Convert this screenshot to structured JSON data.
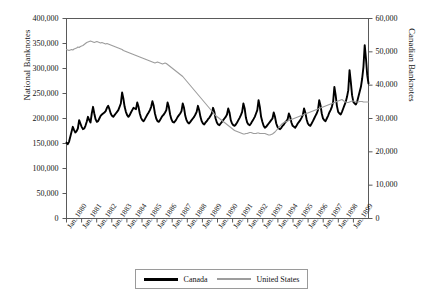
{
  "chart_data": {
    "type": "line",
    "title": "",
    "subtitle": "",
    "xlabel": "",
    "ylabel": "National Banknotes",
    "ylabel_right": "Canadian Banknotes",
    "grid": false,
    "legend_position": "bottom",
    "xlim": [
      "Jan. 1880",
      "Jan. 1899"
    ],
    "ylim": [
      0,
      400000
    ],
    "ylim_right": [
      0,
      60000
    ],
    "yticks": [
      0,
      50000,
      100000,
      150000,
      200000,
      250000,
      300000,
      350000,
      400000
    ],
    "ytick_labels": [
      "0",
      "50,000",
      "100,000",
      "150,000",
      "200,000",
      "250,000",
      "300,000",
      "350,000",
      "400,000"
    ],
    "yticks_right": [
      0,
      10000,
      20000,
      30000,
      40000,
      50000,
      60000
    ],
    "ytick_labels_right": [
      "0",
      "10,000",
      "20,000",
      "30,000",
      "40,000",
      "50,000",
      "60,000"
    ],
    "xtick_labels": [
      "Jan. 1880",
      "Jan. 1881",
      "Jan. 1882",
      "Jan. 1883",
      "Jan. 1884",
      "Jan. 1885",
      "Jan. 1886",
      "Jan. 1887",
      "Jan. 1888",
      "Jan. 1889",
      "Jan. 1890",
      "Jan. 1891",
      "Jan. 1892",
      "Jan. 1893",
      "Jan. 1894",
      "Jan. 1895",
      "Jan. 1896",
      "Jan. 1897",
      "Jan. 1898",
      "Jan. 1899"
    ],
    "series": [
      {
        "name": "Canada",
        "axis": "right",
        "color": "#000000",
        "width": 1.9,
        "units": "Canadian Banknotes",
        "x_start": 1880.0,
        "x_step": 0.0833,
        "values": [
          22800,
          22300,
          23000,
          24500,
          26000,
          27500,
          26500,
          25800,
          26200,
          27000,
          29500,
          28500,
          27500,
          26800,
          27000,
          27800,
          29000,
          30500,
          29500,
          28800,
          31500,
          33500,
          31500,
          29800,
          29000,
          29200,
          30000,
          30800,
          31200,
          31500,
          31800,
          32200,
          33200,
          33800,
          32800,
          31500,
          30800,
          30500,
          31000,
          31500,
          32000,
          32500,
          33500,
          34500,
          37800,
          36000,
          33500,
          32000,
          31000,
          30500,
          31000,
          31800,
          32500,
          33200,
          33000,
          32800,
          34800,
          33500,
          31500,
          30200,
          29500,
          29200,
          29800,
          30500,
          31200,
          31800,
          32500,
          33500,
          35200,
          33800,
          31500,
          30000,
          29200,
          29000,
          29500,
          30200,
          30800,
          31200,
          31800,
          32500,
          34800,
          33500,
          31200,
          29800,
          29000,
          28800,
          29200,
          29800,
          30500,
          31000,
          31500,
          32200,
          34500,
          33200,
          30800,
          29500,
          28800,
          28500,
          29000,
          29500,
          30000,
          30500,
          31200,
          32000,
          33800,
          32500,
          30500,
          29200,
          28500,
          28200,
          28800,
          29200,
          29800,
          30200,
          30800,
          31500,
          33200,
          32000,
          30000,
          28800,
          28200,
          28000,
          28500,
          29000,
          29500,
          30000,
          30500,
          31200,
          33000,
          31800,
          29500,
          28500,
          28000,
          27800,
          28200,
          28800,
          29500,
          30200,
          31000,
          32000,
          34500,
          33000,
          30200,
          28800,
          28200,
          28000,
          28500,
          29200,
          29800,
          30500,
          31500,
          32500,
          35500,
          33500,
          30500,
          29000,
          27800,
          27200,
          27500,
          28000,
          28500,
          29000,
          29500,
          30000,
          31800,
          30500,
          28500,
          27500,
          27000,
          26800,
          27200,
          27800,
          28200,
          28800,
          29200,
          29800,
          31500,
          30500,
          28800,
          27800,
          27500,
          27200,
          27800,
          28500,
          29000,
          29500,
          30200,
          31000,
          33000,
          31800,
          29800,
          28500,
          28000,
          27800,
          28500,
          29200,
          30000,
          30800,
          31500,
          32500,
          35500,
          34000,
          31500,
          30000,
          29500,
          29200,
          30000,
          30800,
          31800,
          32500,
          33500,
          35000,
          39500,
          37000,
          33800,
          32000,
          31500,
          31200,
          32000,
          33000,
          34000,
          35000,
          36500,
          38500,
          44500,
          41000,
          37000,
          35000,
          34500,
          34200,
          35000,
          36500,
          38000,
          39500,
          42000,
          45500,
          52000,
          48000,
          43000,
          40500
        ]
      },
      {
        "name": "United States",
        "axis": "left",
        "color": "#9d9d9d",
        "width": 1.1,
        "units": "National Banknotes",
        "x_start": 1880.0,
        "x_step": 0.0833,
        "values": [
          338000,
          337000,
          336000,
          337000,
          338000,
          337000,
          339000,
          340000,
          341000,
          343000,
          342000,
          344000,
          345000,
          346000,
          348000,
          350000,
          352000,
          353000,
          354000,
          355000,
          354000,
          353000,
          352000,
          353000,
          354000,
          353000,
          352000,
          351000,
          352000,
          351000,
          350000,
          349000,
          350000,
          349000,
          348000,
          347000,
          346000,
          345000,
          344000,
          343000,
          342000,
          341000,
          340000,
          339000,
          338000,
          336000,
          335000,
          334000,
          333000,
          332000,
          331000,
          330000,
          329000,
          328000,
          327000,
          326000,
          325000,
          324000,
          323000,
          322000,
          321000,
          320000,
          319000,
          318000,
          317000,
          316000,
          315000,
          314000,
          313000,
          312000,
          311000,
          312000,
          313000,
          312000,
          311000,
          310000,
          309000,
          310000,
          311000,
          310000,
          308000,
          306000,
          304000,
          302000,
          300000,
          298000,
          296000,
          294000,
          292000,
          290000,
          288000,
          286000,
          284000,
          281000,
          278000,
          275000,
          272000,
          269000,
          266000,
          263000,
          260000,
          257000,
          254000,
          251000,
          248000,
          245000,
          242000,
          239000,
          236000,
          233000,
          230000,
          227000,
          224000,
          221000,
          218000,
          215000,
          212000,
          209000,
          206000,
          204000,
          202000,
          200000,
          198000,
          196000,
          194000,
          192000,
          190000,
          188000,
          186000,
          184000,
          182000,
          180000,
          178000,
          176000,
          175000,
          174000,
          173000,
          172000,
          171000,
          170000,
          169000,
          169000,
          170000,
          170000,
          171000,
          172000,
          172000,
          171000,
          170000,
          170000,
          170000,
          171000,
          171000,
          170000,
          170000,
          170000,
          170000,
          170000,
          169000,
          168000,
          167000,
          167000,
          168000,
          169000,
          171000,
          173000,
          176000,
          179000,
          182000,
          185000,
          188000,
          190000,
          192000,
          193000,
          194000,
          195000,
          196000,
          197000,
          198000,
          199000,
          200000,
          201000,
          202000,
          203000,
          204000,
          205000,
          206000,
          207000,
          208000,
          209000,
          210000,
          211000,
          212000,
          213000,
          214000,
          215000,
          216000,
          217000,
          218000,
          219000,
          220000,
          221000,
          222000,
          223000,
          224000,
          225000,
          226000,
          227000,
          228000,
          229000,
          230000,
          231000,
          232000,
          233000,
          234000,
          235000,
          236000,
          237000,
          238000,
          236000,
          234000,
          233000,
          232000,
          232000,
          233000,
          234000,
          235000,
          235000,
          234000,
          233000,
          233000,
          233000,
          234000,
          234000,
          234000,
          233000,
          233000,
          233000,
          233000,
          233000
        ]
      }
    ]
  },
  "legend": {
    "entries": [
      {
        "label": "Canada",
        "style": "canada"
      },
      {
        "label": "United States",
        "style": "us"
      }
    ]
  }
}
